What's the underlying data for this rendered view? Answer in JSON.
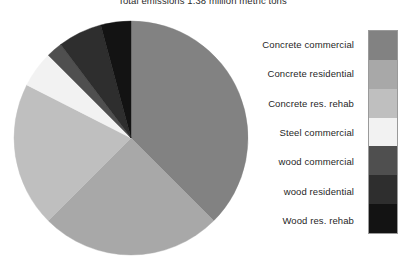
{
  "chart_data": {
    "type": "pie",
    "title": "Total emissions 1.38 million metric tons",
    "xlabel": "",
    "ylabel": "",
    "legend_position": "right",
    "grid": false,
    "categories": [
      "Concrete commercial",
      "Concrete residential",
      "Concrete res. rehab",
      "Steel commercial",
      "wood commercial",
      "wood residential",
      "Wood res. rehab"
    ],
    "values": [
      37.5,
      25.0,
      20.0,
      5.0,
      2.2,
      6.1,
      4.2
    ],
    "unit": "percent",
    "start_angle_deg": 0,
    "direction": "clockwise",
    "slices": [
      {
        "label": "Concrete commercial",
        "value": 37.5,
        "color": "#828282",
        "start_deg": 0,
        "end_deg": 135.0
      },
      {
        "label": "Concrete residential",
        "value": 25.0,
        "color": "#a8a8a8",
        "start_deg": 135.0,
        "end_deg": 225.0
      },
      {
        "label": "Concrete res. rehab",
        "value": 20.0,
        "color": "#bfbfbf",
        "start_deg": 225.0,
        "end_deg": 297.0
      },
      {
        "label": "Steel commercial",
        "value": 5.0,
        "color": "#f2f2f2",
        "start_deg": 297.0,
        "end_deg": 315.0
      },
      {
        "label": "wood commercial",
        "value": 2.2,
        "color": "#4f4f4f",
        "start_deg": 315.0,
        "end_deg": 323.0
      },
      {
        "label": "wood residential",
        "value": 6.1,
        "color": "#2e2e2e",
        "start_deg": 323.0,
        "end_deg": 345.0
      },
      {
        "label": "Wood res. rehab",
        "value": 4.2,
        "color": "#131313",
        "start_deg": 345.0,
        "end_deg": 360.0
      }
    ],
    "geometry": {
      "center_x": 118,
      "center_y": 118,
      "radius": 117
    }
  },
  "legend": {
    "items": [
      {
        "label": "Concrete commercial",
        "color": "#828282"
      },
      {
        "label": "Concrete residential",
        "color": "#a8a8a8"
      },
      {
        "label": "Concrete res. rehab",
        "color": "#bfbfbf"
      },
      {
        "label": "Steel commercial",
        "color": "#f2f2f2"
      },
      {
        "label": "wood commercial",
        "color": "#4f4f4f"
      },
      {
        "label": "wood residential",
        "color": "#2e2e2e"
      },
      {
        "label": "Wood res. rehab",
        "color": "#131313"
      }
    ]
  }
}
